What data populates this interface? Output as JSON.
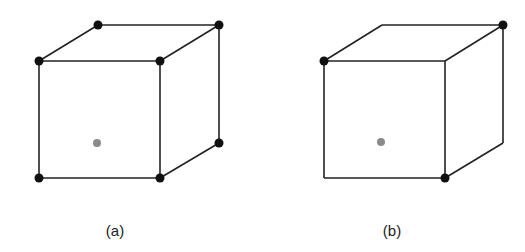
{
  "figures": [
    {
      "id": "a",
      "label": "(a)",
      "edges": [
        [
          39,
          61,
          160,
          61
        ],
        [
          160,
          61,
          160,
          178
        ],
        [
          160,
          178,
          39,
          178
        ],
        [
          39,
          178,
          39,
          61
        ],
        [
          39,
          61,
          98,
          25
        ],
        [
          98,
          25,
          219,
          25
        ],
        [
          219,
          25,
          160,
          61
        ],
        [
          219,
          25,
          219,
          143
        ],
        [
          219,
          143,
          160,
          178
        ]
      ],
      "atoms": [
        [
          39,
          61
        ],
        [
          160,
          61
        ],
        [
          39,
          178
        ],
        [
          160,
          178
        ],
        [
          98,
          25
        ],
        [
          219,
          25
        ],
        [
          219,
          143
        ]
      ],
      "center_atom": [
        97,
        143
      ]
    },
    {
      "id": "b",
      "label": "(b)",
      "edges": [
        [
          324,
          61,
          445,
          61
        ],
        [
          445,
          61,
          445,
          178
        ],
        [
          445,
          178,
          324,
          178
        ],
        [
          324,
          178,
          324,
          61
        ],
        [
          324,
          61,
          382,
          25
        ],
        [
          382,
          25,
          503,
          25
        ],
        [
          503,
          25,
          445,
          61
        ],
        [
          503,
          25,
          503,
          143
        ],
        [
          503,
          143,
          445,
          178
        ]
      ],
      "atoms": [
        [
          324,
          61
        ],
        [
          503,
          25
        ],
        [
          445,
          178
        ]
      ],
      "center_atom": [
        381,
        142
      ]
    }
  ],
  "colors": {
    "edge": "#222222",
    "atom": "#111111",
    "center": "#8a8a8a"
  }
}
